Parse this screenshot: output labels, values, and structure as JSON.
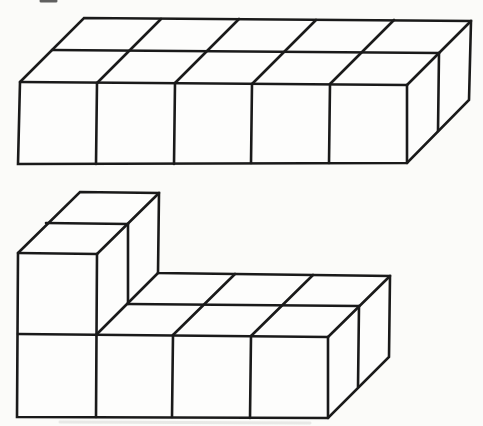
{
  "canvas": {
    "width": 483,
    "height": 426
  },
  "page": {
    "paper_color": "#fbfbf9",
    "face_color": "#fdfdfc",
    "ink_color": "#1a1a1a",
    "stroke_width": 2.6
  },
  "figures": [
    {
      "name": "rectangular-slab-figure",
      "description": "Rectangular prism built from unit cubes, 5 wide x 2 deep x 1 high",
      "cube_count": 10,
      "dimensions": {
        "width_cubes": 5,
        "depth_cubes": 2,
        "height_cubes": 1
      },
      "silhouette": [
        [
          20,
          82
        ],
        [
          84,
          18
        ],
        [
          471,
          21
        ],
        [
          469,
          100
        ],
        [
          407,
          163
        ],
        [
          18,
          164
        ]
      ],
      "edges": [
        {
          "name": "front-top-edge",
          "points": [
            [
              20,
              82
            ],
            [
              407,
              85
            ]
          ]
        },
        {
          "name": "top-face-row-divider",
          "points": [
            [
              52,
              50
            ],
            [
              439,
              53
            ]
          ]
        },
        {
          "name": "top-face-column-divider-1",
          "points": [
            [
              97,
              83
            ],
            [
              161,
              19
            ]
          ]
        },
        {
          "name": "top-face-column-divider-2",
          "points": [
            [
              175,
              83
            ],
            [
              239,
              19
            ]
          ]
        },
        {
          "name": "top-face-column-divider-3",
          "points": [
            [
              252,
              84
            ],
            [
              316,
              20
            ]
          ]
        },
        {
          "name": "top-face-column-divider-4",
          "points": [
            [
              330,
              84
            ],
            [
              394,
              20
            ]
          ]
        },
        {
          "name": "front-face-divider-1",
          "points": [
            [
              97,
              83
            ],
            [
              96,
              164
            ]
          ]
        },
        {
          "name": "front-face-divider-2",
          "points": [
            [
              175,
              83
            ],
            [
              174,
              164
            ]
          ]
        },
        {
          "name": "front-face-divider-3",
          "points": [
            [
              252,
              84
            ],
            [
              251,
              163
            ]
          ]
        },
        {
          "name": "front-face-divider-4",
          "points": [
            [
              330,
              84
            ],
            [
              329,
              163
            ]
          ]
        },
        {
          "name": "top-right-corner-edge",
          "points": [
            [
              407,
              85
            ],
            [
              471,
              21
            ]
          ]
        },
        {
          "name": "front-right-corner-edge",
          "points": [
            [
              407,
              85
            ],
            [
              407,
              163
            ]
          ]
        },
        {
          "name": "side-face-divider",
          "points": [
            [
              439,
              53
            ],
            [
              438,
              131
            ]
          ]
        }
      ]
    },
    {
      "name": "l-shaped-solid-figure",
      "description": "L-shaped solid of unit cubes: base layer 4 wide x 2 deep x 1 high with a 1 wide x 2 deep x 1 high stack on the left column",
      "cube_count": 10,
      "dimensions": {
        "base": "4 x 2 x 1",
        "tower": "1 x 2 x 1"
      },
      "silhouette": [
        [
          18,
          253
        ],
        [
          80,
          192
        ],
        [
          159,
          193
        ],
        [
          158,
          273
        ],
        [
          390,
          276
        ],
        [
          389,
          357
        ],
        [
          328,
          418
        ],
        [
          17,
          417
        ]
      ],
      "edges": [
        {
          "name": "tower-front-top-edge",
          "points": [
            [
              18,
              253
            ],
            [
              97,
              254
            ]
          ]
        },
        {
          "name": "tower-top-row-divider",
          "points": [
            [
              46,
              223
            ],
            [
              128,
              224
            ]
          ]
        },
        {
          "name": "tower-top-right-edge",
          "points": [
            [
              97,
              254
            ],
            [
              159,
              193
            ]
          ]
        },
        {
          "name": "tower-side-divider",
          "points": [
            [
              128,
              224
            ],
            [
              128,
              304
            ]
          ]
        },
        {
          "name": "tower-right-front-edge",
          "points": [
            [
              97,
              254
            ],
            [
              96,
              417
            ]
          ]
        },
        {
          "name": "tower-base-intersection-edge",
          "points": [
            [
              96,
              335
            ],
            [
              158,
              273
            ]
          ]
        },
        {
          "name": "base-front-top-edge",
          "points": [
            [
              18,
              334
            ],
            [
              328,
              337
            ]
          ]
        },
        {
          "name": "base-top-row-divider",
          "points": [
            [
              128,
              304
            ],
            [
              359,
              306
            ]
          ]
        },
        {
          "name": "base-top-column-divider-1",
          "points": [
            [
              173,
              335
            ],
            [
              235,
              274
            ]
          ]
        },
        {
          "name": "base-top-column-divider-2",
          "points": [
            [
              251,
              336
            ],
            [
              313,
              275
            ]
          ]
        },
        {
          "name": "base-front-divider-1",
          "points": [
            [
              173,
              335
            ],
            [
              172,
              417
            ]
          ]
        },
        {
          "name": "base-front-divider-2",
          "points": [
            [
              251,
              336
            ],
            [
              250,
              418
            ]
          ]
        },
        {
          "name": "base-top-right-corner-edge",
          "points": [
            [
              328,
              337
            ],
            [
              390,
              276
            ]
          ]
        },
        {
          "name": "base-front-right-corner-edge",
          "points": [
            [
              328,
              337
            ],
            [
              328,
              418
            ]
          ]
        },
        {
          "name": "base-side-face-divider",
          "points": [
            [
              359,
              306
            ],
            [
              358,
              387
            ]
          ]
        }
      ]
    }
  ],
  "artifacts": [
    {
      "name": "cropped-text-fragment",
      "type": "line",
      "points": [
        [
          41,
          1
        ],
        [
          56,
          1
        ]
      ],
      "color": "#3a3a3a",
      "width": 3,
      "opacity": 0.8
    },
    {
      "name": "pencil-smudge-left",
      "type": "ellipse",
      "cx": 52,
      "cy": 364,
      "rx": 16,
      "ry": 5,
      "color": "#e4e4e0",
      "opacity": 0.8
    },
    {
      "name": "pencil-smudge-right",
      "type": "ellipse",
      "cx": 122,
      "cy": 366,
      "rx": 10,
      "ry": 4,
      "color": "#e8e8e4",
      "opacity": 0.7
    },
    {
      "name": "scan-smear-bottom",
      "type": "line",
      "points": [
        [
          60,
          422
        ],
        [
          310,
          423
        ]
      ],
      "color": "#dcdcd8",
      "width": 3,
      "opacity": 0.6
    }
  ]
}
